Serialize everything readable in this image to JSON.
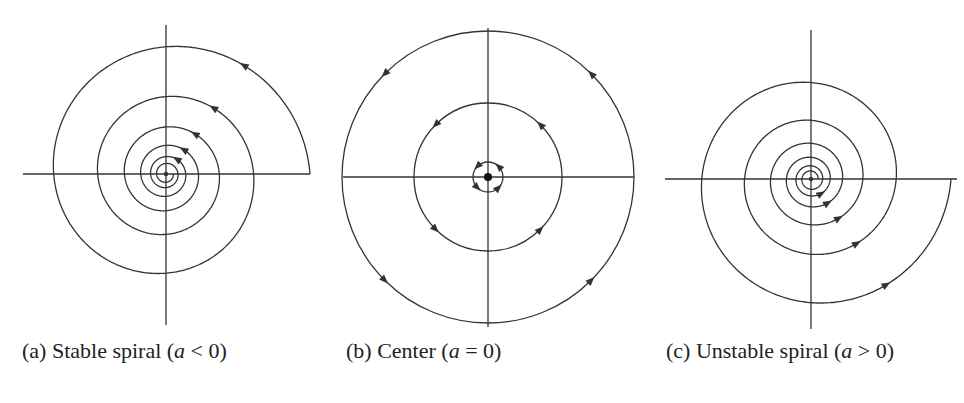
{
  "figure": {
    "panels": [
      {
        "id": "a",
        "type": "stable-spiral",
        "caption_prefix": "(a) Stable spiral (",
        "caption_var": "a",
        "caption_suffix": " < 0)",
        "caption_x": 22,
        "center": [
          166,
          174
        ],
        "axis_h": [
          23,
          310
        ],
        "axis_v": [
          25,
          325
        ],
        "r_start": 144,
        "shrink_per_half_turn": 0.78,
        "turns": 6,
        "direction": "ccw-inward",
        "arrow_count": 5,
        "stroke": "#333333"
      },
      {
        "id": "b",
        "type": "center",
        "caption_prefix": "(b) Center (",
        "caption_var": "a",
        "caption_suffix": " = 0)",
        "caption_x": 346,
        "center": [
          488,
          177
        ],
        "axis_h": [
          343,
          634
        ],
        "axis_v": [
          28,
          327
        ],
        "radii": [
          146,
          74,
          15
        ],
        "direction": "ccw",
        "arrows_per_circle": 4,
        "dot_radius": 4,
        "stroke": "#333333"
      },
      {
        "id": "c",
        "type": "unstable-spiral",
        "caption_prefix": "(c) Unstable spiral (",
        "caption_var": "a",
        "caption_suffix": " > 0)",
        "caption_x": 666,
        "center": [
          811,
          179
        ],
        "axis_h": [
          665,
          957
        ],
        "axis_v": [
          30,
          329
        ],
        "r_start": 140,
        "shrink_per_half_turn": 0.78,
        "turns": 6,
        "direction": "ccw-outward",
        "arrow_count": 5,
        "stroke": "#333333"
      }
    ]
  }
}
